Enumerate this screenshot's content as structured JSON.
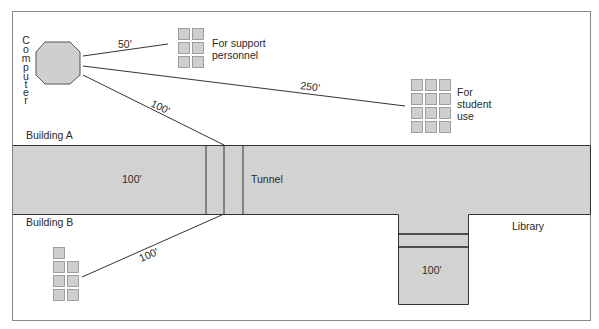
{
  "diagram": {
    "colors": {
      "background": "#ffffff",
      "frame": "#8a8a8a",
      "building_fill": "#d2d2d2",
      "stroke": "#333333",
      "terminal_fill": "#cfcfcf",
      "terminal_stroke": "#8c8c8c"
    },
    "computer": {
      "label": "Computer",
      "label_letters": [
        "C",
        "o",
        "m",
        "p",
        "u",
        "t",
        "e",
        "r"
      ]
    },
    "links": {
      "support": {
        "distance": "50'"
      },
      "student": {
        "distance": "250'"
      },
      "tunnel_a": {
        "distance": "100'"
      },
      "building_b": {
        "distance": "100'"
      }
    },
    "terminal_groups": {
      "support": {
        "label_line1": "For support",
        "label_line2": "personnel",
        "count": 6
      },
      "student": {
        "label_line1": "For",
        "label_line2": "student",
        "label_line3": "use",
        "count": 12
      },
      "building_b": {
        "count": 7
      }
    },
    "areas": {
      "building_a": "Building A",
      "building_b": "Building B",
      "corridor_length": "100'",
      "tunnel": "Tunnel",
      "library": "Library",
      "library_branch_length": "100'"
    }
  }
}
